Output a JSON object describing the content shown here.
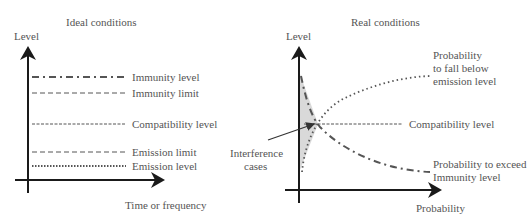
{
  "left_panel": {
    "title": "Ideal conditions",
    "y_axis_label": "Level",
    "x_axis_label": "Time or frequency",
    "lines": [
      {
        "label": "Immunity level",
        "style": "dash-dot",
        "y": 77
      },
      {
        "label": "Immunity limit",
        "style": "dashed",
        "y": 93
      },
      {
        "label": "Compatibility level",
        "style": "fine-dashed",
        "y": 124
      },
      {
        "label": "Emission limit",
        "style": "dashed",
        "y": 152
      },
      {
        "label": "Emission level",
        "style": "dotted",
        "y": 166
      }
    ]
  },
  "right_panel": {
    "title": "Real conditions",
    "y_axis_label": "Level",
    "x_axis_label": "Probability",
    "curve_emission_label_1": "Probability",
    "curve_emission_label_2": "to fall below",
    "curve_emission_label_3": "emission level",
    "compatibility_label": "Compatibility level",
    "curve_immunity_label_1": "Probability to exceed",
    "curve_immunity_label_2": "Immunity level",
    "interference_label_1": "Interference",
    "interference_label_2": "cases"
  },
  "colors": {
    "axis": "#1a1a1a",
    "line": "#555555",
    "shade": "#d9d9d9"
  }
}
